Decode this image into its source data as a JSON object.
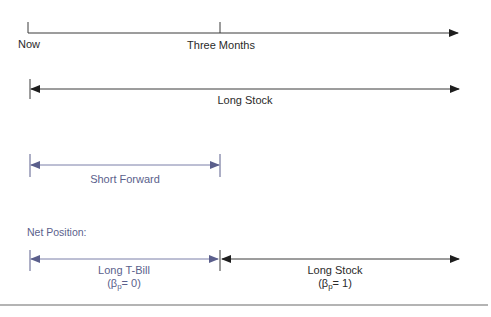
{
  "timeline": {
    "start_label": "Now",
    "mid_label": "Three Months"
  },
  "positions": {
    "long_stock": {
      "label": "Long Stock"
    },
    "short_forward": {
      "label": "Short Forward"
    }
  },
  "net_position": {
    "heading": "Net Position:",
    "long_tbill": {
      "label": "Long T-Bill",
      "beta_prefix": "(β",
      "beta_sub": "p",
      "beta_suffix": "= 0)"
    },
    "long_stock": {
      "label": "Long Stock",
      "beta_prefix": "(β",
      "beta_sub": "p",
      "beta_suffix": "= 1)"
    }
  },
  "colors": {
    "dark": "#2a2a2a",
    "blue": "#5b5f8c"
  }
}
